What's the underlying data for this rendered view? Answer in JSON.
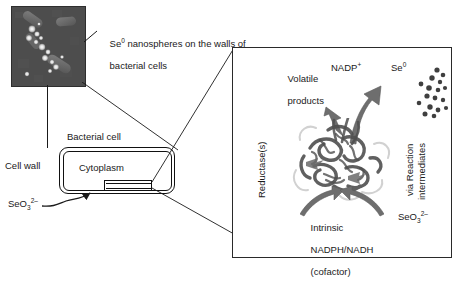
{
  "figure": {
    "background": "#ffffff",
    "line_color": "#1a1a1a",
    "arrow_color": "#6e6e6e",
    "protein_color": "#555555"
  },
  "micrograph": {
    "name": "TEM micrograph of bacterial cells with Se0 nanospheres",
    "caption_line1": "Se",
    "caption_sup": "0",
    "caption_line1_rest": " nanospheres on the walls of",
    "caption_line2": "bacterial cells",
    "background_color": "#4a4a4a"
  },
  "cell_schematic": {
    "bacterial_cell_label": "Bacterial cell",
    "cell_wall_label": "Cell wall",
    "cytoplasm_label": "Cytoplasm",
    "selenite_label_base": "SeO",
    "selenite_label_sub": "3",
    "selenite_label_sup": "2–"
  },
  "panel": {
    "volatile_products_line1": "Volatile",
    "volatile_products_line2": "products",
    "nadp_label": "NADP",
    "nadp_sup": "+",
    "se0_label": "Se",
    "se0_sup": "0",
    "reductase_label": "Reductase(s)",
    "via_reaction_label": "via Reaction",
    "intermediates_label": "intermediates",
    "intrinsic_line1": "Intrinsic",
    "intrinsic_line2": "NADPH/NADH",
    "intrinsic_line3": "(cofactor)",
    "selenite_label_base": "SeO",
    "selenite_label_sub": "3",
    "selenite_label_sup": "2–"
  },
  "nanosphere_dots": {
    "count": 17,
    "color": "#3f3f3f",
    "points": [
      [
        30,
        8
      ],
      [
        36,
        13
      ],
      [
        25,
        16
      ],
      [
        33,
        20
      ],
      [
        14,
        22
      ],
      [
        22,
        26
      ],
      [
        31,
        28
      ],
      [
        38,
        26
      ],
      [
        20,
        34
      ],
      [
        28,
        36
      ],
      [
        36,
        38
      ],
      [
        12,
        41
      ],
      [
        23,
        45
      ],
      [
        31,
        48
      ],
      [
        39,
        46
      ],
      [
        18,
        52
      ],
      [
        27,
        54
      ]
    ]
  }
}
